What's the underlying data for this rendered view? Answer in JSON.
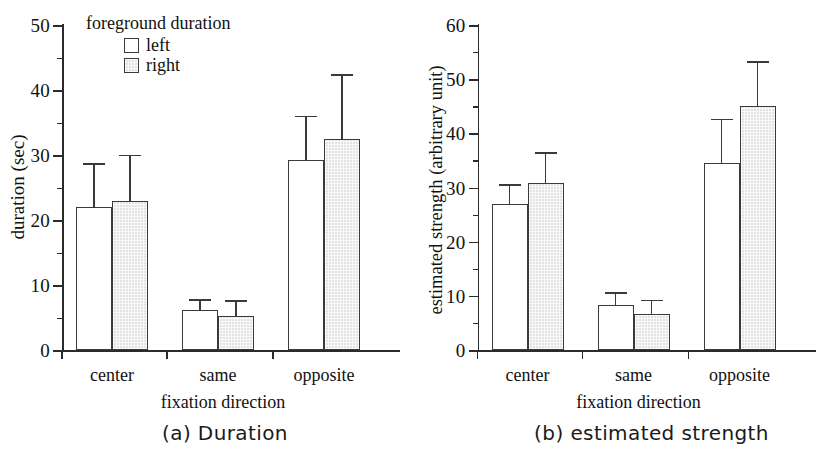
{
  "figure": {
    "panels": [
      {
        "id": "panel-a",
        "caption": "(a)  Duration",
        "ylabel": "duration (sec)",
        "xlabel": "fixation direction",
        "legend": {
          "title": "foreground duration",
          "items": [
            {
              "label": "left",
              "swatch": "white"
            },
            {
              "label": "right",
              "swatch": "gray"
            }
          ]
        }
      },
      {
        "id": "panel-b",
        "caption": "(b)  estimated strength",
        "ylabel": "estimated strength  (arbitrary unit)",
        "xlabel": "fixation direction",
        "legend": null
      }
    ]
  },
  "chart_data": [
    {
      "type": "bar",
      "id": "panel-a",
      "title": "(a)  Duration",
      "xlabel": "fixation direction",
      "ylabel": "duration (sec)",
      "categories": [
        "center",
        "same",
        "opposite"
      ],
      "ylim": [
        0,
        50
      ],
      "ytick_labels": [
        "0",
        "10",
        "20",
        "30",
        "40",
        "50"
      ],
      "ytick_values": [
        0,
        10,
        20,
        30,
        40,
        50
      ],
      "yminor_values": [
        5,
        15,
        25,
        35,
        45
      ],
      "grid": false,
      "legend_position": "top-left",
      "series": [
        {
          "name": "left",
          "color": "#ffffff",
          "values": [
            22.0,
            6.2,
            29.2
          ],
          "errors_upper": [
            28.5,
            7.6,
            35.8
          ]
        },
        {
          "name": "right",
          "color": "#e3e3e3",
          "values": [
            23.0,
            5.2,
            32.5
          ],
          "errors_upper": [
            29.8,
            7.4,
            42.2
          ]
        }
      ]
    },
    {
      "type": "bar",
      "id": "panel-b",
      "title": "(b)  estimated strength",
      "xlabel": "fixation direction",
      "ylabel": "estimated strength  (arbitrary unit)",
      "categories": [
        "center",
        "same",
        "opposite"
      ],
      "ylim": [
        0,
        60
      ],
      "ytick_labels": [
        "0",
        "10",
        "20",
        "30",
        "40",
        "50",
        "60"
      ],
      "ytick_values": [
        0,
        10,
        20,
        30,
        40,
        50,
        60
      ],
      "yminor_values": [
        5,
        15,
        25,
        35,
        45,
        55
      ],
      "grid": false,
      "legend_position": "none",
      "series": [
        {
          "name": "left",
          "color": "#ffffff",
          "values": [
            27.0,
            8.4,
            34.5
          ],
          "errors_upper": [
            30.3,
            10.4,
            42.4
          ]
        },
        {
          "name": "right",
          "color": "#e3e3e3",
          "values": [
            30.9,
            6.7,
            45.0
          ],
          "errors_upper": [
            36.2,
            9.0,
            53.0
          ]
        }
      ]
    }
  ]
}
